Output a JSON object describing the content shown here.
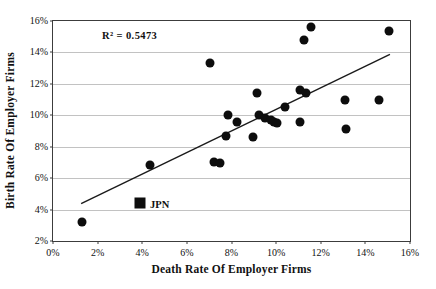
{
  "figure": {
    "background": "#ffffff",
    "marker_color": "#0d0d0d",
    "gridline_color": "#c2c2c2",
    "frame_color": "#3c3c3c",
    "trendline_color": "#1a1a1a"
  },
  "chart_data": {
    "type": "scatter",
    "title": "",
    "xlabel": "Death Rate Of Employer Firms",
    "ylabel": "Birth Rate Of Employer Firms",
    "annotation": "R² = 0.5473",
    "xlim": [
      0,
      16
    ],
    "ylim": [
      2,
      16
    ],
    "grid": "horizontal-only",
    "legend": "none",
    "x_ticks": [
      {
        "v": 0,
        "label": "0%"
      },
      {
        "v": 2,
        "label": "2%"
      },
      {
        "v": 4,
        "label": "4%"
      },
      {
        "v": 6,
        "label": "6%"
      },
      {
        "v": 8,
        "label": "8%"
      },
      {
        "v": 10,
        "label": "10%"
      },
      {
        "v": 12,
        "label": "12%"
      },
      {
        "v": 14,
        "label": "14%"
      },
      {
        "v": 16,
        "label": "16%"
      }
    ],
    "y_ticks": [
      {
        "v": 2,
        "label": "2%"
      },
      {
        "v": 4,
        "label": "4%"
      },
      {
        "v": 6,
        "label": "6%"
      },
      {
        "v": 8,
        "label": "8%"
      },
      {
        "v": 10,
        "label": "10%"
      },
      {
        "v": 12,
        "label": "12%"
      },
      {
        "v": 14,
        "label": "14%"
      },
      {
        "v": 16,
        "label": "16%"
      }
    ],
    "series": [
      {
        "name": "employer-firm-rates",
        "marker": "circle",
        "points": [
          [
            1.3,
            3.2
          ],
          [
            4.35,
            6.85
          ],
          [
            7.05,
            13.35
          ],
          [
            7.2,
            7.0
          ],
          [
            7.5,
            6.95
          ],
          [
            7.75,
            8.7
          ],
          [
            7.85,
            10.0
          ],
          [
            8.25,
            9.55
          ],
          [
            8.95,
            8.6
          ],
          [
            9.15,
            11.45
          ],
          [
            9.25,
            10.05
          ],
          [
            9.5,
            9.85
          ],
          [
            9.75,
            9.7
          ],
          [
            9.9,
            9.6
          ],
          [
            10.05,
            9.5
          ],
          [
            10.4,
            10.5
          ],
          [
            11.05,
            9.6
          ],
          [
            11.05,
            11.6
          ],
          [
            11.27,
            14.8
          ],
          [
            11.35,
            11.4
          ],
          [
            11.57,
            15.65
          ],
          [
            13.1,
            11.0
          ],
          [
            13.15,
            9.15
          ],
          [
            14.6,
            11.0
          ],
          [
            15.05,
            15.35
          ]
        ]
      },
      {
        "name": "japan-highlight",
        "marker": "square",
        "label": "JPN",
        "points": [
          [
            3.9,
            4.4
          ]
        ]
      }
    ],
    "trendline": {
      "x1": 1.26,
      "y1": 4.38,
      "x2": 15.1,
      "y2": 13.87,
      "r_squared": "0.5473"
    }
  }
}
